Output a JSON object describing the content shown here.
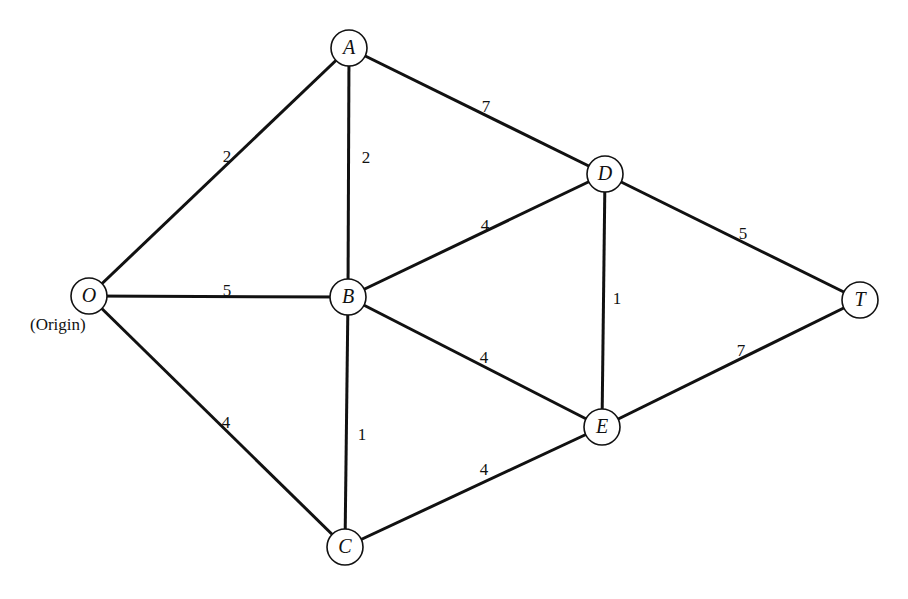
{
  "diagram": {
    "type": "weighted-undirected-graph",
    "node_radius": 18,
    "colors": {
      "stroke": "#111111",
      "background": "#ffffff"
    },
    "nodes": [
      {
        "id": "O",
        "label": "O",
        "x": 89,
        "y": 296,
        "annotation": "(Origin)"
      },
      {
        "id": "A",
        "label": "A",
        "x": 349,
        "y": 48
      },
      {
        "id": "B",
        "label": "B",
        "x": 348,
        "y": 297
      },
      {
        "id": "C",
        "label": "C",
        "x": 345,
        "y": 547
      },
      {
        "id": "D",
        "label": "D",
        "x": 605,
        "y": 174
      },
      {
        "id": "E",
        "label": "E",
        "x": 602,
        "y": 427
      },
      {
        "id": "T",
        "label": "T",
        "x": 860,
        "y": 300
      }
    ],
    "edges": [
      {
        "from": "O",
        "to": "A",
        "weight": "2",
        "lx": 227,
        "ly": 158
      },
      {
        "from": "O",
        "to": "B",
        "weight": "5",
        "lx": 227,
        "ly": 292
      },
      {
        "from": "O",
        "to": "C",
        "weight": "4",
        "lx": 226,
        "ly": 424
      },
      {
        "from": "A",
        "to": "B",
        "weight": "2",
        "lx": 366,
        "ly": 159
      },
      {
        "from": "A",
        "to": "D",
        "weight": "7",
        "lx": 486,
        "ly": 108
      },
      {
        "from": "B",
        "to": "D",
        "weight": "4",
        "lx": 485,
        "ly": 227
      },
      {
        "from": "B",
        "to": "E",
        "weight": "4",
        "lx": 484,
        "ly": 359
      },
      {
        "from": "B",
        "to": "C",
        "weight": "1",
        "lx": 362,
        "ly": 436
      },
      {
        "from": "C",
        "to": "E",
        "weight": "4",
        "lx": 484,
        "ly": 471
      },
      {
        "from": "D",
        "to": "E",
        "weight": "1",
        "lx": 617,
        "ly": 300
      },
      {
        "from": "D",
        "to": "T",
        "weight": "5",
        "lx": 743,
        "ly": 235
      },
      {
        "from": "E",
        "to": "T",
        "weight": "7",
        "lx": 741,
        "ly": 352
      }
    ]
  }
}
